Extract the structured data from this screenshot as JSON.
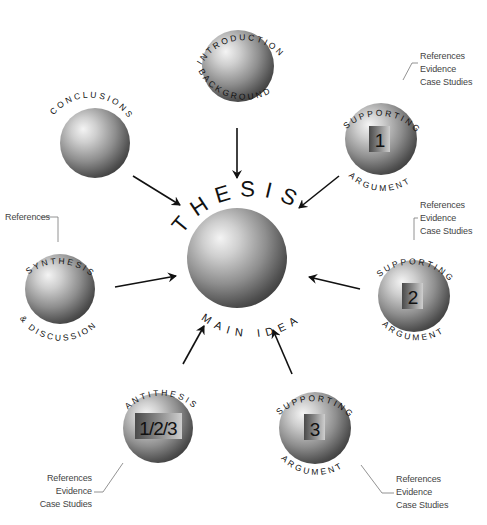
{
  "diagram": {
    "center": {
      "top_label": "THESIS",
      "bottom_label": "MAIN IDEA"
    },
    "nodes": {
      "introduction": {
        "top_label": "INTRODUCTION",
        "bottom_label": "BACKGROUND"
      },
      "conclusions": {
        "top_label": "CONCLUSIONS"
      },
      "supporting1": {
        "top_label": "SUPPORTING",
        "bottom_label": "ARGUMENT",
        "number": "1"
      },
      "supporting2": {
        "top_label": "SUPPORTING",
        "bottom_label": "ARGUMENT",
        "number": "2"
      },
      "supporting3": {
        "top_label": "SUPPORTING",
        "bottom_label": "ARGUMENT",
        "number": "3"
      },
      "synthesis": {
        "top_label": "SYNTHESIS",
        "bottom_label": "& DISCUSSION"
      },
      "antithesis": {
        "top_label": "ANTITHESIS",
        "number": "1/2/3"
      }
    },
    "notes": {
      "supporting1": [
        "References",
        "Evidence",
        "Case Studies"
      ],
      "supporting2": [
        "References",
        "Evidence",
        "Case Studies"
      ],
      "supporting3": [
        "References",
        "Evidence",
        "Case Studies"
      ],
      "synthesis": [
        "References"
      ],
      "antithesis": [
        "References",
        "Evidence",
        "Case Studies"
      ]
    },
    "colors": {
      "sphere_light": "#f2f2f2",
      "sphere_mid": "#9a9a9a",
      "sphere_dark": "#3a3a3a",
      "arrow": "#111111",
      "leader_line": "#777777"
    }
  }
}
